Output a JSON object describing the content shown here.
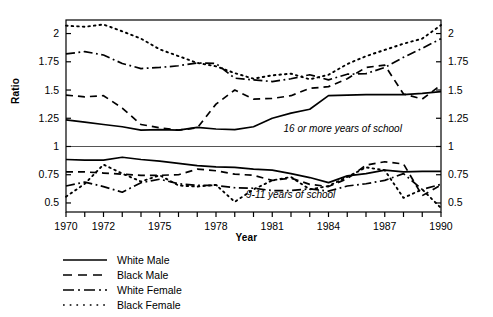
{
  "chart_data": {
    "type": "line",
    "title": "",
    "xlabel": "Year",
    "ylabel": "Ratio",
    "xlim": [
      1970,
      1990
    ],
    "ylim": [
      0.42,
      2.12
    ],
    "grid": false,
    "reference_line": {
      "value": 1,
      "label": "1"
    },
    "x": [
      1970,
      1971,
      1972,
      1973,
      1974,
      1975,
      1976,
      1977,
      1978,
      1979,
      1980,
      1981,
      1982,
      1983,
      1984,
      1985,
      1986,
      1987,
      1988,
      1989,
      1990
    ],
    "x_tick_labels": [
      "1970",
      "1972",
      "1975",
      "1978",
      "1981",
      "1984",
      "1987",
      "1990"
    ],
    "x_tick_values": [
      1970,
      1972,
      1975,
      1978,
      1981,
      1984,
      1987,
      1990
    ],
    "y_ticks": [
      0.5,
      0.75,
      1,
      1.25,
      1.5,
      1.75,
      2
    ],
    "y_tick_labels": [
      "0.5",
      "0.75",
      "1",
      "1.25",
      "1.5",
      "1.75",
      "2"
    ],
    "legend_position": "below-left",
    "annotations": [
      {
        "text": "16 or more years of school",
        "x": 1981.6,
        "y": 1.13
      },
      {
        "text": "9-11 years of school",
        "x": 1979.6,
        "y": 0.545
      }
    ],
    "panels": [
      {
        "name": "16 or more years of school",
        "series": [
          {
            "name": "White Male",
            "style": "solid",
            "values": [
              1.235,
              1.215,
              1.195,
              1.175,
              1.145,
              1.15,
              1.145,
              1.17,
              1.155,
              1.15,
              1.175,
              1.25,
              1.295,
              1.33,
              1.45,
              1.455,
              1.46,
              1.46,
              1.46,
              1.47,
              1.485
            ]
          },
          {
            "name": "Black Male",
            "style": "dashed",
            "values": [
              1.455,
              1.44,
              1.45,
              1.34,
              1.195,
              1.165,
              1.145,
              1.165,
              1.375,
              1.5,
              1.42,
              1.425,
              1.45,
              1.515,
              1.53,
              1.6,
              1.7,
              1.72,
              1.465,
              1.42,
              1.545
            ]
          },
          {
            "name": "White Female",
            "style": "dashdot",
            "values": [
              1.82,
              1.84,
              1.81,
              1.735,
              1.69,
              1.7,
              1.715,
              1.74,
              1.735,
              1.605,
              1.59,
              1.575,
              1.6,
              1.635,
              1.59,
              1.64,
              1.645,
              1.7,
              1.79,
              1.87,
              1.955
            ]
          },
          {
            "name": "Black Female",
            "style": "dotted",
            "values": [
              2.07,
              2.06,
              2.08,
              2.02,
              1.955,
              1.86,
              1.8,
              1.74,
              1.71,
              1.65,
              1.6,
              1.63,
              1.645,
              1.595,
              1.635,
              1.73,
              1.8,
              1.855,
              1.91,
              1.955,
              2.075
            ]
          }
        ]
      },
      {
        "name": "9-11 years of school",
        "series": [
          {
            "name": "White Male",
            "style": "solid",
            "values": [
              0.885,
              0.88,
              0.88,
              0.905,
              0.885,
              0.87,
              0.85,
              0.83,
              0.82,
              0.815,
              0.8,
              0.79,
              0.76,
              0.725,
              0.68,
              0.74,
              0.76,
              0.79,
              0.775,
              0.78,
              0.78
            ]
          },
          {
            "name": "Black Male",
            "style": "dashed",
            "values": [
              0.775,
              0.775,
              0.765,
              0.755,
              0.745,
              0.745,
              0.75,
              0.8,
              0.785,
              0.755,
              0.745,
              0.7,
              0.72,
              0.665,
              0.645,
              0.715,
              0.835,
              0.865,
              0.845,
              0.565,
              0.66
            ]
          },
          {
            "name": "White Female",
            "style": "dashdot",
            "values": [
              0.65,
              0.685,
              0.645,
              0.595,
              0.68,
              0.71,
              0.67,
              0.655,
              0.655,
              0.635,
              0.63,
              0.61,
              0.61,
              0.625,
              0.605,
              0.65,
              0.67,
              0.7,
              0.76,
              0.62,
              0.665
            ]
          },
          {
            "name": "Black Female",
            "style": "dotted",
            "values": [
              0.555,
              0.67,
              0.84,
              0.76,
              0.69,
              0.745,
              0.655,
              0.645,
              0.66,
              0.51,
              0.62,
              0.7,
              0.73,
              0.62,
              0.65,
              0.73,
              0.815,
              0.79,
              0.545,
              0.62,
              0.455
            ]
          }
        ]
      }
    ]
  },
  "axes": {
    "ylabel": "Ratio",
    "xlabel": "Year"
  },
  "legend": {
    "items": [
      {
        "label": "White Male",
        "style": "solid"
      },
      {
        "label": "Black Male",
        "style": "dashed"
      },
      {
        "label": "White Female",
        "style": "dashdot"
      },
      {
        "label": "Black Female",
        "style": "dotted"
      }
    ]
  }
}
